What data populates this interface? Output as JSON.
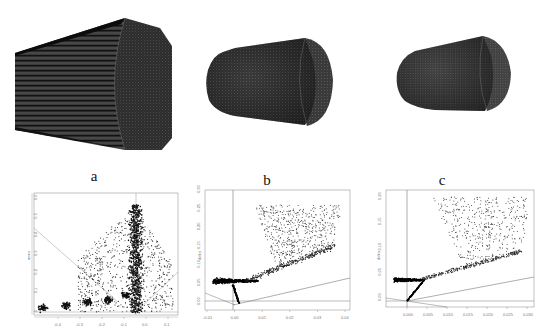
{
  "figure": {
    "panels": [
      {
        "id": "a",
        "label": "a",
        "shape": "elongated mesh cylinder (side striped)"
      },
      {
        "id": "b",
        "label": "b",
        "shape": "truncated cone mesh"
      },
      {
        "id": "c",
        "label": "c",
        "shape": "truncated cone mesh"
      }
    ]
  },
  "chart_data": [
    {
      "type": "scatter",
      "title": "",
      "panel": "a",
      "xlabel": "",
      "ylabel": "delta",
      "x_ticks": [
        "-0.4",
        "-0.3",
        "-0.2",
        "-0.1",
        "0.0",
        "0.1"
      ],
      "y_ticks": [
        "0",
        "0.1",
        "0.2",
        "0.3",
        "0.4",
        "0.5",
        "0.6"
      ],
      "xlim": [
        -0.45,
        0.15
      ],
      "ylim": [
        0,
        0.62
      ],
      "reference_lines": [
        "vertical at x=0",
        "horizontal at y=0",
        "diagonal from upper-left",
        "diagonal from lower-right"
      ],
      "description": "Fan-shaped point cloud; dense vertical band near x=0 reaching y≈0.6; clusters along the bottom between x=-0.4 and 0.0"
    },
    {
      "type": "scatter",
      "title": "",
      "panel": "b",
      "xlabel": "",
      "ylabel": "delta",
      "x_ticks": [
        "-0.01",
        "0.00",
        "0.01",
        "0.02",
        "0.03",
        "0.04"
      ],
      "y_ticks": [
        "0.00",
        "0.05",
        "0.10",
        "0.15",
        "0.20",
        "0.25",
        "0.30"
      ],
      "xlim": [
        -0.012,
        0.045
      ],
      "ylim": [
        -0.005,
        0.3
      ],
      "reference_lines": [
        "vertical at x=0",
        "horizontal near y=0",
        "rising diagonal line",
        "falling short diagonal"
      ],
      "description": "Dense dark arrowhead cluster around x≈0, y≈0.05 with a tail running along a rising line and a broad upper fan reaching y≈0.29 around x≈0.02-0.03"
    },
    {
      "type": "scatter",
      "title": "",
      "panel": "c",
      "xlabel": "",
      "ylabel": "delta",
      "x_ticks": [
        "0.000",
        "0.005",
        "0.010",
        "0.015",
        "0.020",
        "0.025",
        "0.030"
      ],
      "y_ticks": [
        "0.00",
        "0.05",
        "0.10",
        "0.15",
        "0.20"
      ],
      "xlim": [
        -0.003,
        0.033
      ],
      "ylim": [
        -0.005,
        0.22
      ],
      "reference_lines": [
        "vertical at x=0",
        "horizontal near y=0",
        "rising diagonal line",
        "falling short diagonal"
      ],
      "description": "Dense arrowhead cluster at x≈0, y≈0.05; upward branch to y≈0 and a long rising band plus wide upper fan reaching y≈0.21 near x≈0.022"
    }
  ]
}
